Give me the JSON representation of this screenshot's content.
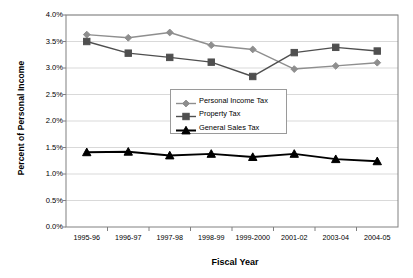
{
  "chart_data": {
    "type": "line",
    "title": "",
    "xlabel": "Fiscal Year",
    "ylabel": "Percent of Personal Income",
    "categories": [
      "1995-96",
      "1996-97",
      "1997-98",
      "1998-99",
      "1999-2000",
      "2001-02",
      "2003-04",
      "2004-05"
    ],
    "ylim": [
      0.0,
      4.0
    ],
    "ytick_labels": [
      "4.0%",
      "3.5%",
      "3.0%",
      "2.5%",
      "2.0%",
      "1.5%",
      "1.0%",
      "0.5%",
      "0.0%"
    ],
    "ytick_values": [
      4.0,
      3.5,
      3.0,
      2.5,
      2.0,
      1.5,
      1.0,
      0.5,
      0.0
    ],
    "grid": "horizontal",
    "legend_position": "center",
    "series": [
      {
        "name": "Personal Income Tax",
        "marker": "diamond",
        "color": "#8e8e8e",
        "values": [
          3.63,
          3.57,
          3.67,
          3.43,
          3.35,
          2.98,
          3.04,
          3.1
        ]
      },
      {
        "name": "Property Tax",
        "marker": "square",
        "color": "#4f4f4f",
        "values": [
          3.5,
          3.28,
          3.2,
          3.11,
          2.84,
          3.29,
          3.39,
          3.32
        ]
      },
      {
        "name": "General Sales Tax",
        "marker": "triangle",
        "color": "#000000",
        "values": [
          1.41,
          1.42,
          1.35,
          1.38,
          1.32,
          1.38,
          1.28,
          1.24
        ]
      }
    ]
  },
  "axes": {
    "x_title": "Fiscal Year",
    "y_title": "Percent of Personal Income"
  },
  "legend": {
    "items": [
      {
        "label": "Personal Income Tax"
      },
      {
        "label": "Property Tax"
      },
      {
        "label": "General Sales Tax"
      }
    ]
  },
  "colors": {
    "personal_income_tax": "#8e8e8e",
    "property_tax": "#4f4f4f",
    "general_sales_tax": "#000000",
    "gridline": "#d9d9d9",
    "axis": "#808080",
    "background": "#ffffff"
  }
}
